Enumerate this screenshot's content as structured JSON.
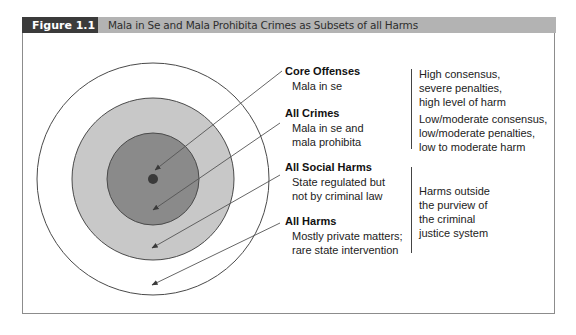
{
  "header": {
    "figure_label": "Figure 1.1",
    "title": "Mala in Se and Mala Prohibita Crimes as Subsets of all Harms"
  },
  "colors": {
    "header_band": "#b3b3b3",
    "figure_label_bg": "#3b3b3b",
    "core_dot": "#3a3a3a",
    "all_crimes_fill": "#8a8a8a",
    "social_harms_fill": "#c8c8c8",
    "all_harms_fill": "#ffffff",
    "stroke": "#4a4a4a"
  },
  "circles": [
    {
      "name": "All Harms",
      "cx": 153,
      "cy": 179,
      "r": 116
    },
    {
      "name": "All Social Harms",
      "cx": 153,
      "cy": 179,
      "r": 81
    },
    {
      "name": "All Crimes",
      "cx": 153,
      "cy": 179,
      "r": 46
    },
    {
      "name": "Core Offenses",
      "cx": 153,
      "cy": 179,
      "r": 5
    }
  ],
  "categories": [
    {
      "title": "Core Offenses",
      "lines": [
        "Mala in se"
      ]
    },
    {
      "title": "All Crimes",
      "lines": [
        "Mala in se and",
        "mala prohibita"
      ]
    },
    {
      "title": "All Social Harms",
      "lines": [
        "State regulated but",
        "not by criminal law"
      ]
    },
    {
      "title": "All Harms",
      "lines": [
        "Mostly private matters;",
        "rare state intervention"
      ]
    }
  ],
  "descriptions": [
    {
      "lines": [
        "High consensus,",
        "severe penalties,",
        "high level of harm"
      ]
    },
    {
      "lines": [
        "Low/moderate consensus,",
        "low/moderate penalties,",
        "low to moderate harm"
      ]
    },
    {
      "lines": [
        "Harms outside",
        "the purview of",
        "the criminal",
        "justice system"
      ]
    }
  ]
}
